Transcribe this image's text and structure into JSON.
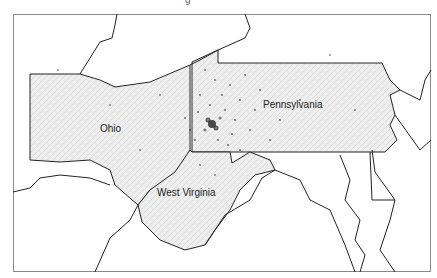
{
  "map": {
    "title_fragment": "g",
    "states": [
      {
        "name": "Ohio",
        "label_x": 100,
        "label_y": 128
      },
      {
        "name": "Pennsylvania",
        "label_x": 263,
        "label_y": 104
      },
      {
        "name": "West Virginia",
        "label_x": 157,
        "label_y": 192
      }
    ],
    "colors": {
      "border": "#222222",
      "fill_stippled": "#e8e8e8",
      "points": "#111111",
      "frame": "#8a8a8a"
    },
    "point_cluster": {
      "center_x": 212,
      "center_y": 124,
      "description": "dense dot cluster near Pittsburgh"
    }
  }
}
